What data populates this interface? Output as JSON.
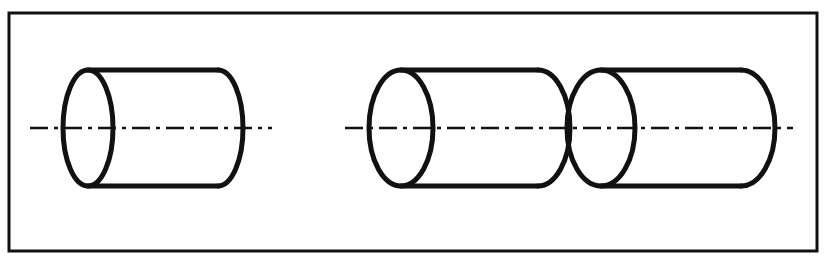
{
  "figure": {
    "kind": "engineering-line-drawing",
    "title": "Three cylinders aligned on a common horizontal axis",
    "canvas": {
      "width": 830,
      "height": 257
    },
    "background_color": "#ffffff",
    "ink_color": "#111111"
  },
  "frame": {
    "label": "border-frame",
    "x": 9,
    "y": 13,
    "width": 808,
    "height": 238,
    "stroke_width": 3,
    "stroke_color": "#111111",
    "fill": "none"
  },
  "style": {
    "outline_stroke_width": 5,
    "outline_color": "#111111",
    "centerline_stroke_width": 2.4,
    "centerline_color": "#111111",
    "centerline_dash_pattern": "18 6 4 6"
  },
  "axis": {
    "label": "common-horizontal-axis",
    "y": 128
  },
  "cylinders": [
    {
      "id": "cylinder-left",
      "name": "left-cylinder",
      "order": 1,
      "group": "left",
      "front_ellipse": {
        "cx": 88,
        "cy": 128,
        "rx": 25,
        "ry": 58
      },
      "body": {
        "x_start": 88,
        "x_end": 218,
        "y_top": 70,
        "y_bottom": 186
      },
      "end_cap": {
        "cx": 218,
        "cy": 128,
        "rx": 25,
        "ry": 58,
        "side": "right"
      },
      "length": 155,
      "diameter": 116
    },
    {
      "id": "cylinder-middle",
      "name": "middle-cylinder",
      "order": 2,
      "group": "right",
      "front_ellipse": {
        "cx": 401,
        "cy": 128,
        "rx": 32,
        "ry": 58
      },
      "body": {
        "x_start": 401,
        "x_end": 538,
        "y_top": 70,
        "y_bottom": 186
      },
      "end_cap": {
        "cx": 538,
        "cy": 128,
        "rx": 32,
        "ry": 58,
        "side": "right"
      },
      "length": 169,
      "diameter": 116
    },
    {
      "id": "cylinder-right",
      "name": "right-cylinder",
      "order": 3,
      "group": "right",
      "front_ellipse": {
        "cx": 601,
        "cy": 128,
        "rx": 34,
        "ry": 58
      },
      "body": {
        "x_start": 601,
        "x_end": 741,
        "y_top": 70,
        "y_bottom": 186
      },
      "end_cap": {
        "cx": 741,
        "cy": 128,
        "rx": 34,
        "ry": 58,
        "side": "right"
      },
      "length": 174,
      "diameter": 116
    }
  ],
  "centerlines": [
    {
      "id": "centerline-left",
      "name": "centerline-left-cylinder",
      "x_start": 30,
      "x_end": 272,
      "y": 128
    },
    {
      "id": "centerline-right",
      "name": "centerline-right-cylinder-pair",
      "x_start": 345,
      "x_end": 793,
      "y": 128
    }
  ],
  "annotations": {
    "visible_text": [],
    "dimensions_shown": false,
    "hatching_shown": false
  }
}
